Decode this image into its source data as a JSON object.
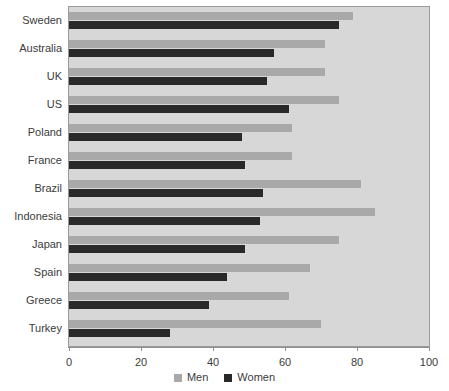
{
  "chart_data": {
    "type": "bar",
    "orientation": "horizontal",
    "title": "",
    "xlabel": "",
    "ylabel": "",
    "xlim": [
      0,
      100
    ],
    "xticks": [
      0,
      20,
      40,
      60,
      80,
      100
    ],
    "grid": false,
    "legend_position": "bottom",
    "categories": [
      "Sweden",
      "Australia",
      "UK",
      "US",
      "Poland",
      "France",
      "Brazil",
      "Indonesia",
      "Japan",
      "Spain",
      "Greece",
      "Turkey"
    ],
    "series": [
      {
        "name": "Men",
        "color": "#a9a9a9",
        "values": [
          79,
          71,
          71,
          75,
          62,
          62,
          81,
          85,
          75,
          67,
          61,
          70
        ]
      },
      {
        "name": "Women",
        "color": "#292929",
        "values": [
          75,
          57,
          55,
          61,
          48,
          49,
          54,
          53,
          49,
          44,
          39,
          28
        ]
      }
    ]
  },
  "axis": {
    "tick_labels": [
      "0",
      "20",
      "40",
      "60",
      "80",
      "100"
    ]
  },
  "legend": {
    "items": [
      {
        "label": "Men",
        "color": "#a9a9a9"
      },
      {
        "label": "Women",
        "color": "#292929"
      }
    ]
  }
}
